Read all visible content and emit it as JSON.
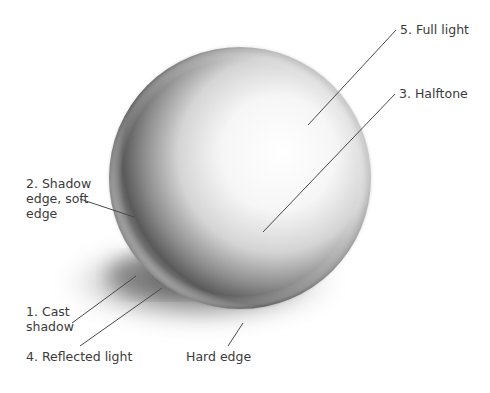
{
  "diagram": {
    "colors": {
      "background": "#ffffff",
      "label_text": "#3a3a3a",
      "leader_line": "#4a4a4a",
      "shadow_dark": "#3c3c3c",
      "highlight": "#ffffff"
    },
    "labels": [
      {
        "id": "full-light",
        "text": "5. Full light"
      },
      {
        "id": "halftone",
        "text": "3. Halftone"
      },
      {
        "id": "shadow-edge",
        "text": "2. Shadow\nedge, soft\nedge"
      },
      {
        "id": "cast-shadow",
        "text": "1. Cast\nshadow"
      },
      {
        "id": "reflected-light",
        "text": "4. Reflected light"
      },
      {
        "id": "hard-edge",
        "text": "Hard edge"
      }
    ]
  }
}
